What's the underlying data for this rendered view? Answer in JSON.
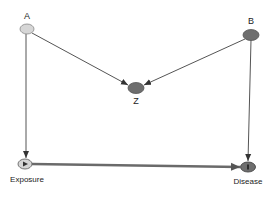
{
  "diagram": {
    "type": "DAG",
    "nodes": [
      {
        "id": "A",
        "label": "A",
        "x": 27,
        "y": 29,
        "fill": "#d6d6d6",
        "label_pos": "above"
      },
      {
        "id": "B",
        "label": "B",
        "x": 251,
        "y": 35,
        "fill": "#6e6e6e",
        "label_pos": "above"
      },
      {
        "id": "Z",
        "label": "Z",
        "x": 136,
        "y": 88,
        "fill": "#6e6e6e",
        "label_pos": "below"
      },
      {
        "id": "Exposure",
        "label": "Exposure",
        "x": 25,
        "y": 164,
        "fill": "#d6d6d6",
        "marker": "triangle",
        "label_pos": "below"
      },
      {
        "id": "Disease",
        "label": "Disease",
        "x": 248,
        "y": 167,
        "fill": "#6e6e6e",
        "marker": "bar",
        "label_pos": "below"
      }
    ],
    "edges": [
      {
        "from": "A",
        "to": "Z"
      },
      {
        "from": "B",
        "to": "Z"
      },
      {
        "from": "A",
        "to": "Exposure"
      },
      {
        "from": "B",
        "to": "Disease"
      },
      {
        "from": "Exposure",
        "to": "Disease",
        "style": "thick"
      }
    ]
  },
  "labels": {
    "A": "A",
    "B": "B",
    "Z": "Z",
    "Exposure": "Exposure",
    "Disease": "Disease"
  },
  "colors": {
    "edge": "#555555",
    "causal_edge": "#6a6a6a",
    "light_node": "#d6d6d6",
    "dark_node": "#6e6e6e",
    "node_stroke": "#777777"
  }
}
